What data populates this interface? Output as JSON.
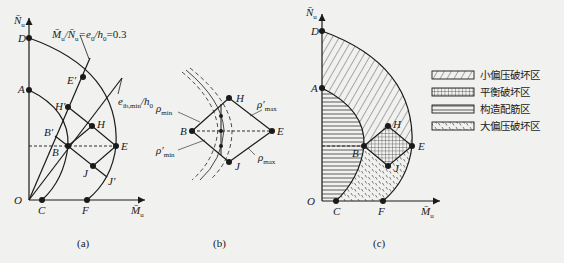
{
  "panels": {
    "a": {
      "caption": "(a)",
      "axis_y": "N̄u",
      "axis_x": "M̄u",
      "annotation_line": "M̄u/N̄u=e0/h0=0.3",
      "annotation_curve": "eib,min/h0",
      "points": [
        "D",
        "E'",
        "A",
        "H'",
        "H",
        "B'",
        "B",
        "E",
        "J",
        "J'",
        "O",
        "C",
        "F"
      ]
    },
    "b": {
      "caption": "(b)",
      "points": [
        "H",
        "B",
        "E",
        "J"
      ],
      "labels": {
        "rho_min": "ρmin",
        "rho_min_prime": "ρ'min",
        "rho_max": "ρmax",
        "rho_max_prime": "ρ'max"
      }
    },
    "c": {
      "caption": "(c)",
      "axis_y": "N̄u",
      "axis_x": "M̄u",
      "points": [
        "D",
        "A",
        "H",
        "B",
        "E",
        "J",
        "O",
        "C",
        "F"
      ]
    }
  },
  "legend": {
    "items": [
      {
        "pattern": "diagonal-hatch",
        "label": "小偏压破坏区"
      },
      {
        "pattern": "cross-hatch",
        "label": "平衡破坏区"
      },
      {
        "pattern": "horizontal-lines",
        "label": "构造配筋区"
      },
      {
        "pattern": "dotted",
        "label": "大偏压破坏区"
      }
    ]
  },
  "text": {
    "a_title_part1": "M̄",
    "labels": {
      "D": "D",
      "Ep": "E′",
      "A": "A",
      "Hp": "H′",
      "H": "H",
      "Bp": "B′",
      "B": "B",
      "E": "E",
      "J": "J",
      "Jp": "J′",
      "O": "O",
      "C": "C",
      "F": "F"
    }
  }
}
